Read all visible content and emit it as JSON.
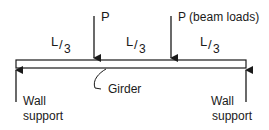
{
  "diagram": {
    "loads": [
      {
        "label": "P"
      },
      {
        "label": "P (beam loads)"
      }
    ],
    "spans": [
      {
        "num": "L",
        "den": "3"
      },
      {
        "num": "L",
        "den": "3"
      },
      {
        "num": "L",
        "den": "3"
      }
    ],
    "girder_label": "Girder",
    "supports": [
      {
        "line1": "Wall",
        "line2": "support"
      },
      {
        "line1": "Wall",
        "line2": "support"
      }
    ],
    "colors": {
      "line": "#1a1a1a",
      "beam_fill": "#ffffff"
    }
  }
}
